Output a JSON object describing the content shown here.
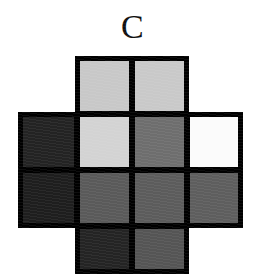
{
  "figure": {
    "label": "C",
    "shape": "plus-cross",
    "background_color": "#ffffff",
    "border_color": "#000000",
    "border_width_px": 5,
    "grid_columns": 4,
    "grid_rows": 4
  },
  "chart_data": {
    "type": "heatmap",
    "title": "C",
    "xlabel": "",
    "ylabel": "",
    "grid": true,
    "legend_position": "none",
    "categories": [
      "col1",
      "col2",
      "col3",
      "col4"
    ],
    "row_labels": [
      "row1",
      "row2",
      "row3",
      "row4"
    ],
    "note": "Plus-shaped grayscale patch array; the four corner cells of the 4x4 grid are absent (white background).",
    "cells": [
      {
        "row": 1,
        "col": 1,
        "present": false,
        "color": null,
        "gray_value": null
      },
      {
        "row": 1,
        "col": 2,
        "present": true,
        "color": "#c8c8c8",
        "gray_value": 200
      },
      {
        "row": 1,
        "col": 3,
        "present": true,
        "color": "#c9c9c9",
        "gray_value": 201
      },
      {
        "row": 1,
        "col": 4,
        "present": false,
        "color": null,
        "gray_value": null
      },
      {
        "row": 2,
        "col": 1,
        "present": true,
        "color": "#232323",
        "gray_value": 35
      },
      {
        "row": 2,
        "col": 2,
        "present": true,
        "color": "#d3d3d3",
        "gray_value": 211
      },
      {
        "row": 2,
        "col": 3,
        "present": true,
        "color": "#6e6e6e",
        "gray_value": 110
      },
      {
        "row": 2,
        "col": 4,
        "present": true,
        "color": "#fbfbfb",
        "gray_value": 251
      },
      {
        "row": 3,
        "col": 1,
        "present": true,
        "color": "#1e1e1e",
        "gray_value": 30
      },
      {
        "row": 3,
        "col": 2,
        "present": true,
        "color": "#5a5a5a",
        "gray_value": 90
      },
      {
        "row": 3,
        "col": 3,
        "present": true,
        "color": "#5c5c5c",
        "gray_value": 92
      },
      {
        "row": 3,
        "col": 4,
        "present": true,
        "color": "#5e5e5e",
        "gray_value": 94
      },
      {
        "row": 4,
        "col": 1,
        "present": false,
        "color": null,
        "gray_value": null
      },
      {
        "row": 4,
        "col": 2,
        "present": true,
        "color": "#242424",
        "gray_value": 36
      },
      {
        "row": 4,
        "col": 3,
        "present": true,
        "color": "#555555",
        "gray_value": 85
      },
      {
        "row": 4,
        "col": 4,
        "present": false,
        "color": null,
        "gray_value": null
      }
    ],
    "values": [
      [
        null,
        200,
        201,
        null
      ],
      [
        35,
        211,
        110,
        251
      ],
      [
        30,
        90,
        92,
        94
      ],
      [
        null,
        36,
        85,
        null
      ]
    ]
  }
}
